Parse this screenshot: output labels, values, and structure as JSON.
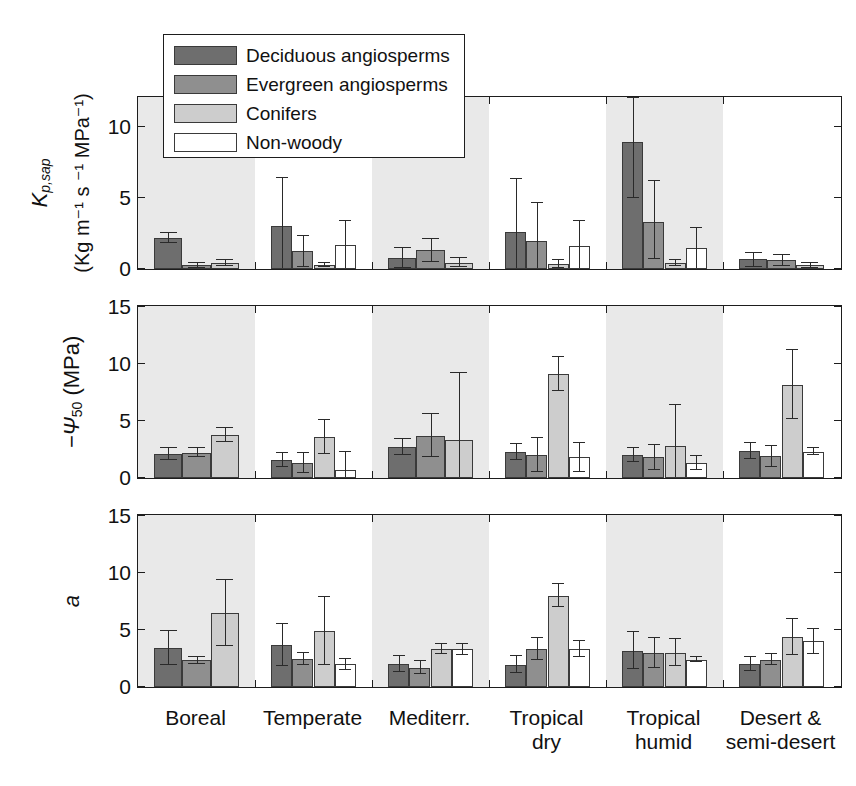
{
  "figure": {
    "width": 856,
    "height": 786,
    "background": "#ffffff",
    "band_color": "#e9e9e9",
    "axis_color": "#1d1d1d"
  },
  "legend": {
    "position": "top-left-inside-panel-1",
    "entries": [
      {
        "label": "Deciduous angiosperms",
        "color": "#6e6e6e",
        "swatch": "dark-gray"
      },
      {
        "label": "Evergreen angiosperms",
        "color": "#8f8f8f",
        "swatch": "medium-gray"
      },
      {
        "label": "Conifers",
        "color": "#cdcdcd",
        "swatch": "light-gray"
      },
      {
        "label": "Non-woody",
        "color": "#ffffff",
        "swatch": "white"
      }
    ]
  },
  "x_labels": [
    {
      "line1": "Boreal",
      "line2": ""
    },
    {
      "line1": "Temperate",
      "line2": ""
    },
    {
      "line1": "Mediterr.",
      "line2": ""
    },
    {
      "line1": "Tropical",
      "line2": "dry"
    },
    {
      "line1": "Tropical",
      "line2": "humid"
    },
    {
      "line1": "Desert &",
      "line2": "semi-desert"
    }
  ],
  "chart_data": [
    {
      "type": "bar",
      "panel": 1,
      "title": "",
      "xlabel": "",
      "ylabel": "K_p,sap (Kg m^-1 s^-1 MPa^-1)",
      "ylabel_main": "K",
      "ylabel_main_sub": "p,sap",
      "ylabel_units": "(Kg m⁻¹ s ⁻¹ MPa⁻¹)",
      "ylim": [
        0,
        12
      ],
      "yticks": [
        0,
        5,
        10
      ],
      "ytick_labels": [
        "0",
        "5",
        "10"
      ],
      "grid": false,
      "legend_position": "inside-top-left",
      "categories": [
        "Boreal",
        "Temperate",
        "Mediterr.",
        "Tropical dry",
        "Tropical humid",
        "Desert & semi-desert"
      ],
      "shaded_categories": [
        "Boreal",
        "Mediterr.",
        "Tropical humid"
      ],
      "series": [
        {
          "name": "Deciduous angiosperms",
          "values": [
            2.2,
            3.0,
            0.75,
            2.6,
            8.9,
            0.7
          ],
          "errors_up": [
            2.55,
            6.4,
            1.45,
            6.3,
            12.0,
            1.15
          ],
          "errors_down": [
            1.85,
            0.0,
            0.1,
            0.0,
            5.0,
            0.15
          ]
        },
        {
          "name": "Evergreen angiosperms",
          "values": [
            0.25,
            1.25,
            1.3,
            2.0,
            3.3,
            0.6
          ],
          "errors_up": [
            0.45,
            2.35,
            2.1,
            4.6,
            6.2,
            1.0
          ],
          "errors_down": [
            0.05,
            0.15,
            0.5,
            0.0,
            0.7,
            0.2
          ]
        },
        {
          "name": "Conifers",
          "values": [
            0.4,
            0.3,
            0.45,
            0.35,
            0.4,
            0.25
          ],
          "errors_up": [
            0.6,
            0.45,
            0.75,
            0.6,
            0.6,
            0.4
          ],
          "errors_down": [
            0.2,
            0.15,
            0.15,
            0.1,
            0.2,
            0.1
          ]
        },
        {
          "name": "Non-woody",
          "values": [
            null,
            1.7,
            null,
            1.65,
            1.45,
            null
          ],
          "errors_up": [
            null,
            3.4,
            null,
            3.4,
            2.9,
            null
          ],
          "errors_down": [
            null,
            0.0,
            null,
            0.0,
            0.0,
            null
          ]
        }
      ]
    },
    {
      "type": "bar",
      "panel": 2,
      "title": "",
      "xlabel": "",
      "ylabel": "-Ψ_50 (MPa)",
      "ylabel_main": "−Ψ",
      "ylabel_main_sub": "50",
      "ylabel_units": "(MPa)",
      "ylim": [
        0,
        15
      ],
      "yticks": [
        0,
        5,
        10,
        15
      ],
      "ytick_labels": [
        "0",
        "5",
        "10",
        "15"
      ],
      "grid": false,
      "legend_position": "none",
      "categories": [
        "Boreal",
        "Temperate",
        "Mediterr.",
        "Tropical dry",
        "Tropical humid",
        "Desert & semi-desert"
      ],
      "shaded_categories": [
        "Boreal",
        "Mediterr.",
        "Tropical humid"
      ],
      "series": [
        {
          "name": "Deciduous angiosperms",
          "values": [
            2.1,
            1.6,
            2.7,
            2.3,
            2.0,
            2.4
          ],
          "errors_up": [
            2.6,
            2.2,
            3.4,
            3.0,
            2.6,
            3.1
          ],
          "errors_down": [
            1.6,
            1.0,
            2.0,
            1.6,
            1.4,
            1.7
          ]
        },
        {
          "name": "Evergreen angiosperms",
          "values": [
            2.2,
            1.3,
            3.7,
            2.0,
            1.8,
            1.9
          ],
          "errors_up": [
            2.6,
            2.2,
            5.6,
            3.5,
            2.9,
            2.8
          ],
          "errors_down": [
            1.8,
            0.4,
            1.8,
            0.5,
            0.7,
            1.0
          ]
        },
        {
          "name": "Conifers",
          "values": [
            3.75,
            3.6,
            3.3,
            9.1,
            2.8,
            8.2
          ],
          "errors_up": [
            4.35,
            5.1,
            9.2,
            10.6,
            6.4,
            11.2
          ],
          "errors_down": [
            3.15,
            2.1,
            0.0,
            7.6,
            0.0,
            5.2
          ]
        },
        {
          "name": "Non-woody",
          "values": [
            null,
            0.7,
            null,
            1.8,
            1.3,
            2.3
          ],
          "errors_up": [
            null,
            2.3,
            null,
            3.1,
            1.9,
            2.6
          ],
          "errors_down": [
            null,
            0.0,
            null,
            0.5,
            0.7,
            2.0
          ]
        }
      ]
    },
    {
      "type": "bar",
      "panel": 3,
      "title": "",
      "xlabel": "",
      "ylabel": "a",
      "ylabel_main": "a",
      "ylabel_main_sub": "",
      "ylabel_units": "",
      "ylim": [
        0,
        15
      ],
      "yticks": [
        0,
        5,
        10,
        15
      ],
      "ytick_labels": [
        "0",
        "5",
        "10",
        "15"
      ],
      "grid": false,
      "legend_position": "none",
      "categories": [
        "Boreal",
        "Temperate",
        "Mediterr.",
        "Tropical dry",
        "Tropical humid",
        "Desert & semi-desert"
      ],
      "shaded_categories": [
        "Boreal",
        "Mediterr.",
        "Tropical humid"
      ],
      "series": [
        {
          "name": "Deciduous angiosperms",
          "values": [
            3.4,
            3.65,
            2.0,
            1.95,
            3.2,
            2.0
          ],
          "errors_up": [
            4.9,
            5.5,
            2.7,
            2.7,
            4.8,
            2.6
          ],
          "errors_down": [
            1.9,
            1.8,
            1.3,
            1.2,
            1.6,
            1.4
          ]
        },
        {
          "name": "Evergreen angiosperms",
          "values": [
            2.35,
            2.45,
            1.7,
            3.35,
            3.0,
            2.4
          ],
          "errors_up": [
            2.65,
            3.0,
            2.3,
            4.3,
            4.3,
            2.9
          ],
          "errors_down": [
            2.05,
            1.9,
            1.1,
            2.4,
            1.7,
            1.9
          ]
        },
        {
          "name": "Conifers",
          "values": [
            6.5,
            4.9,
            3.35,
            8.0,
            3.0,
            4.4
          ],
          "errors_up": [
            9.4,
            7.9,
            3.8,
            9.0,
            4.2,
            6.0
          ],
          "errors_down": [
            3.6,
            1.9,
            2.9,
            7.0,
            1.8,
            2.8
          ]
        },
        {
          "name": "Non-woody",
          "values": [
            null,
            2.0,
            3.3,
            3.3,
            2.4,
            4.0
          ],
          "errors_up": [
            null,
            2.5,
            3.8,
            4.0,
            2.6,
            5.1
          ],
          "errors_down": [
            null,
            1.5,
            2.8,
            2.6,
            2.2,
            2.9
          ]
        }
      ]
    }
  ]
}
